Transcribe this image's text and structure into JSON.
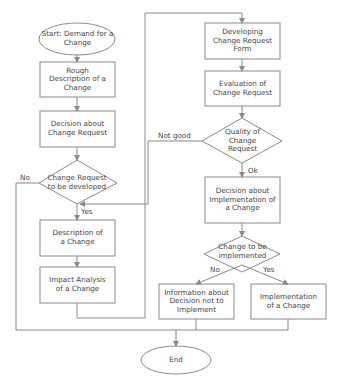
{
  "diagram": {
    "type": "flowchart",
    "colors": {
      "stroke": "#8a8a8a",
      "text": "#444444",
      "background": "#ffffff"
    },
    "nodes": {
      "start": {
        "shape": "ellipse",
        "text": "Start: Demand for a Change"
      },
      "rough_description": {
        "shape": "rect",
        "text": "Rough Description of a Change"
      },
      "decision_cr": {
        "shape": "rect",
        "text": "Decision about Change Request"
      },
      "cr_to_be_developed": {
        "shape": "diamond",
        "text": "Change Request to be developed"
      },
      "description": {
        "shape": "rect",
        "text": "Description of a Change"
      },
      "impact_analysis": {
        "shape": "rect",
        "text": "Impact Analysis of a Change"
      },
      "developing_form": {
        "shape": "rect",
        "text": "Developing Change Request Form"
      },
      "evaluation": {
        "shape": "rect",
        "text": "Evaluation of Change Request"
      },
      "quality": {
        "shape": "diamond",
        "text": "Quality of Change Request"
      },
      "decision_impl": {
        "shape": "rect",
        "text": "Decision about Implementation of a Change"
      },
      "change_to_be_impl": {
        "shape": "diamond",
        "text": "Change to be implemented"
      },
      "info_not_impl": {
        "shape": "rect",
        "text": "Information about Decision not to Implement"
      },
      "implementation": {
        "shape": "rect",
        "text": "Implementation of a Change"
      },
      "end": {
        "shape": "ellipse",
        "text": "End"
      }
    },
    "edge_labels": {
      "no_left": "No",
      "yes_left": "Yes",
      "not_good": "Not good",
      "ok": "Ok",
      "no_right": "No",
      "yes_right": "Yes"
    },
    "edges": [
      [
        "start",
        "rough_description"
      ],
      [
        "rough_description",
        "decision_cr"
      ],
      [
        "decision_cr",
        "cr_to_be_developed"
      ],
      [
        "cr_to_be_developed",
        "description",
        "Yes"
      ],
      [
        "cr_to_be_developed",
        "end",
        "No"
      ],
      [
        "description",
        "impact_analysis"
      ],
      [
        "impact_analysis",
        "developing_form"
      ],
      [
        "developing_form",
        "evaluation"
      ],
      [
        "evaluation",
        "quality"
      ],
      [
        "quality",
        "decision_impl",
        "Ok"
      ],
      [
        "quality",
        "description",
        "Not good"
      ],
      [
        "decision_impl",
        "change_to_be_impl"
      ],
      [
        "change_to_be_impl",
        "info_not_impl",
        "No"
      ],
      [
        "change_to_be_impl",
        "implementation",
        "Yes"
      ],
      [
        "info_not_impl",
        "end"
      ],
      [
        "implementation",
        "end"
      ]
    ]
  }
}
